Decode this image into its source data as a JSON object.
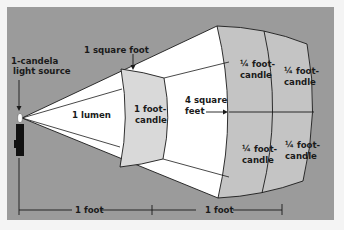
{
  "diagram": {
    "colors": {
      "page_background": "#f4f4f4",
      "panel_background": "#9b9b9b",
      "cone_fill": "#ffffff",
      "patch_fill": "#d9d9d9",
      "outer_patch_fill": "#c8c8c8",
      "line": "#1a1a1a"
    },
    "labels": {
      "source_line1": "1-candela",
      "source_line2": "light source",
      "square_foot": "1 square foot",
      "lumen": "1 lumen",
      "near_patch_line1": "1 foot-",
      "near_patch_line2": "candle",
      "four_sq_line1": "4 square",
      "four_sq_line2": "feet",
      "quarter_tl_line1": "¼ foot-",
      "quarter_tl_line2": "candle",
      "quarter_tr_line1": "¼ foot-",
      "quarter_tr_line2": "candle",
      "quarter_bl_line1": "¼ foot-",
      "quarter_bl_line2": "candle",
      "quarter_br_line1": "¼ foot-",
      "quarter_br_line2": "candle",
      "distance_1": "1 foot",
      "distance_2": "1 foot"
    }
  }
}
